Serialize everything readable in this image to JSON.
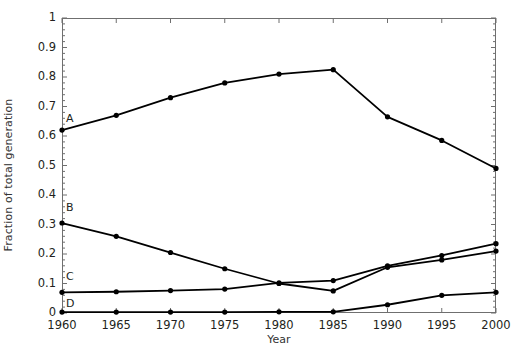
{
  "chart_data": {
    "type": "line",
    "title": "",
    "xlabel": "Year",
    "ylabel": "Fraction of total generation",
    "x": [
      1960,
      1965,
      1970,
      1975,
      1980,
      1985,
      1990,
      1995,
      2000
    ],
    "xticklabels": [
      "1960",
      "1965",
      "1970",
      "1975",
      "1980",
      "1985",
      "1990",
      "1995",
      "2000"
    ],
    "yticklabels": [
      "0",
      "0.1",
      "0.2",
      "0.3",
      "0.4",
      "0.5",
      "0.6",
      "0.7",
      "0.8",
      "0.9",
      "1"
    ],
    "yticks": [
      0,
      0.1,
      0.2,
      0.3,
      0.4,
      0.5,
      0.6,
      0.7,
      0.8,
      0.9,
      1
    ],
    "xlim": [
      1960,
      2000
    ],
    "ylim": [
      0,
      1
    ],
    "grid": false,
    "legend_position": "inline-left-labels",
    "marker": "filled-circle",
    "line_color": "#000000",
    "series": [
      {
        "name": "A",
        "label": "A",
        "values": [
          0.62,
          0.67,
          0.73,
          0.78,
          0.81,
          0.825,
          0.665,
          0.585,
          0.49
        ]
      },
      {
        "name": "B",
        "label": "B",
        "values": [
          0.305,
          0.26,
          0.205,
          0.15,
          0.1,
          0.075,
          0.155,
          0.18,
          0.21
        ]
      },
      {
        "name": "C",
        "label": "C",
        "values": [
          0.07,
          0.072,
          0.076,
          0.081,
          0.102,
          0.11,
          0.16,
          0.195,
          0.235
        ]
      },
      {
        "name": "D",
        "label": "D",
        "values": [
          0.003,
          0.003,
          0.003,
          0.003,
          0.004,
          0.004,
          0.028,
          0.06,
          0.07
        ]
      }
    ]
  },
  "axes": {
    "frame_color": "#6f6f6f",
    "tick_color": "#6f6f6f"
  }
}
